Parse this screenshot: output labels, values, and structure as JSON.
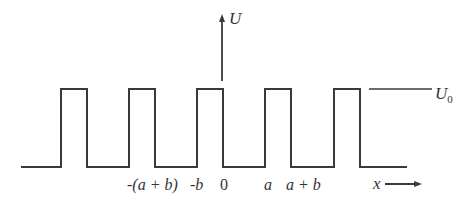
{
  "diagram": {
    "colors": {
      "stroke": "#3a3a3a",
      "text": "#333333",
      "background": "#ffffff"
    },
    "axes": {
      "vertical_label": "U",
      "horizontal_label": "x"
    },
    "level_label": {
      "main": "U",
      "subscript": "0"
    },
    "pulse_count": 5,
    "tick_labels": [
      {
        "id": "neg-a-plus-b",
        "text": "-(a + b)"
      },
      {
        "id": "neg-b",
        "text": "-b"
      },
      {
        "id": "zero",
        "text": "0"
      },
      {
        "id": "a",
        "text": "a"
      },
      {
        "id": "a-plus-b",
        "text": "a + b"
      }
    ]
  }
}
